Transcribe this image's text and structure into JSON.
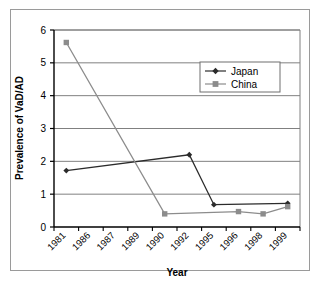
{
  "chart_data": {
    "type": "line",
    "title": "",
    "xlabel": "Year",
    "ylabel": "Prevalence of VaD/AD",
    "categories": [
      "1981",
      "1986",
      "1987",
      "1989",
      "1990",
      "1992",
      "1995",
      "1996",
      "1998",
      "1999"
    ],
    "ylim": [
      0,
      6
    ],
    "yticks": [
      0,
      1,
      2,
      3,
      4,
      5,
      6
    ],
    "grid": "horizontal",
    "legend_position": "top-right",
    "series": [
      {
        "name": "Japan",
        "marker": "diamond",
        "color": "#2b2b2b",
        "points": [
          {
            "x": "1981",
            "y": 1.72
          },
          {
            "x": "1992",
            "y": 2.2
          },
          {
            "x": "1995",
            "y": 0.68
          },
          {
            "x": "1999",
            "y": 0.72
          }
        ]
      },
      {
        "name": "China",
        "marker": "square",
        "color": "#8c8c8c",
        "points": [
          {
            "x": "1981",
            "y": 5.62
          },
          {
            "x": "1990",
            "y": 0.4
          },
          {
            "x": "1996",
            "y": 0.47
          },
          {
            "x": "1998",
            "y": 0.4
          },
          {
            "x": "1999",
            "y": 0.62
          }
        ]
      }
    ]
  },
  "legend": {
    "items": [
      {
        "label": "Japan"
      },
      {
        "label": "China"
      }
    ]
  },
  "axes": {
    "y_title": "Prevalence of VaD/AD",
    "x_title": "Year",
    "y_tick_labels": [
      "0",
      "1",
      "2",
      "3",
      "4",
      "5",
      "6"
    ],
    "x_tick_labels": [
      "1981",
      "1986",
      "1987",
      "1989",
      "1990",
      "1992",
      "1995",
      "1996",
      "1998",
      "1999"
    ]
  },
  "colors": {
    "japan": "#2b2b2b",
    "china": "#8c8c8c",
    "grid": "#808080",
    "axis": "#000000",
    "frame": "#9a9a9a",
    "background": "#ffffff"
  }
}
